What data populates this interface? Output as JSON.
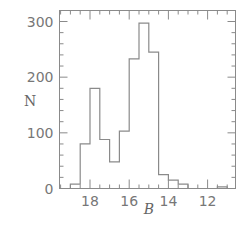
{
  "chart_data": {
    "type": "bar",
    "style": "step-histogram",
    "title": "",
    "xlabel": "B",
    "ylabel": "N",
    "x_inverted": true,
    "xlim": [
      19.5,
      10.8
    ],
    "ylim": [
      0,
      320
    ],
    "x_ticks": [
      18,
      16,
      14,
      12
    ],
    "x_tick_labels": [
      "18",
      "16",
      "14",
      "12"
    ],
    "y_ticks": [
      0,
      100,
      200,
      300
    ],
    "y_tick_labels": [
      "0",
      "100",
      "200",
      "300"
    ],
    "grid": false,
    "legend": null,
    "bin_width": 0.5,
    "bins": [
      {
        "from": 19.0,
        "to": 18.5,
        "count": 8
      },
      {
        "from": 18.5,
        "to": 18.0,
        "count": 80
      },
      {
        "from": 18.0,
        "to": 17.5,
        "count": 180
      },
      {
        "from": 17.5,
        "to": 17.0,
        "count": 88
      },
      {
        "from": 17.0,
        "to": 16.5,
        "count": 48
      },
      {
        "from": 16.5,
        "to": 16.0,
        "count": 103
      },
      {
        "from": 16.0,
        "to": 15.5,
        "count": 233
      },
      {
        "from": 15.5,
        "to": 15.0,
        "count": 297
      },
      {
        "from": 15.0,
        "to": 14.5,
        "count": 245
      },
      {
        "from": 14.5,
        "to": 14.0,
        "count": 25
      },
      {
        "from": 14.0,
        "to": 13.5,
        "count": 15
      },
      {
        "from": 13.5,
        "to": 13.0,
        "count": 8
      },
      {
        "from": 13.0,
        "to": 12.5,
        "count": 0
      },
      {
        "from": 12.5,
        "to": 12.0,
        "count": 0
      },
      {
        "from": 12.0,
        "to": 11.5,
        "count": 0
      },
      {
        "from": 11.5,
        "to": 11.0,
        "count": 3
      }
    ],
    "categories": [
      "19.0-18.5",
      "18.5-18.0",
      "18.0-17.5",
      "17.5-17.0",
      "17.0-16.5",
      "16.5-16.0",
      "16.0-15.5",
      "15.5-15.0",
      "15.0-14.5",
      "14.5-14.0",
      "14.0-13.5",
      "13.5-13.0",
      "13.0-12.5",
      "12.5-12.0",
      "12.0-11.5",
      "11.5-11.0"
    ],
    "values": [
      8,
      80,
      180,
      88,
      48,
      103,
      233,
      297,
      245,
      25,
      15,
      8,
      0,
      0,
      0,
      3
    ]
  },
  "colors": {
    "line": "#8a8a8a",
    "text": "#777777"
  }
}
